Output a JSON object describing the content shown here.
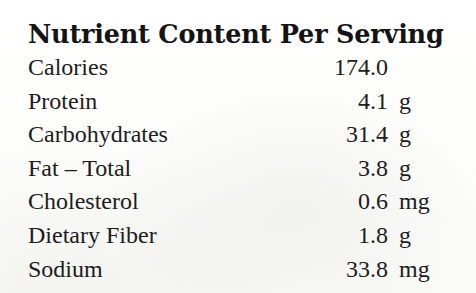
{
  "panel": {
    "title": "Nutrient Content Per Serving",
    "rows": [
      {
        "label": "Calories",
        "value": "174.0",
        "unit": ""
      },
      {
        "label": "Protein",
        "value": "4.1",
        "unit": "g"
      },
      {
        "label": "Carbohydrates",
        "value": "31.4",
        "unit": "g"
      },
      {
        "label": "Fat – Total",
        "value": "3.8",
        "unit": "g"
      },
      {
        "label": "Cholesterol",
        "value": "0.6",
        "unit": "mg"
      },
      {
        "label": "Dietary Fiber",
        "value": "1.8",
        "unit": "g"
      },
      {
        "label": "Sodium",
        "value": "33.8",
        "unit": "mg"
      }
    ]
  },
  "colors": {
    "text": "#1c1c1c",
    "title": "#141414",
    "background": "#fdfdfc"
  }
}
